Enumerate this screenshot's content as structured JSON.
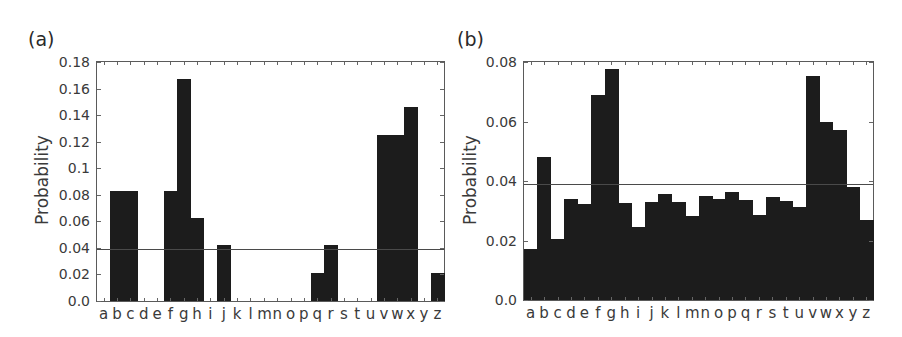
{
  "panels": [
    {
      "label": "(a)",
      "ylabel": "Probability"
    },
    {
      "label": "(b)",
      "ylabel": "Probability"
    }
  ],
  "chart_data": [
    {
      "type": "bar",
      "title": "(a)",
      "xlabel": "",
      "ylabel": "Probability",
      "ylim": [
        0,
        0.18
      ],
      "yticks": [
        "0.0",
        "0.02",
        "0.04",
        "0.06",
        "0.08",
        "0.1",
        "0.12",
        "0.14",
        "0.16",
        "0.18"
      ],
      "ytick_values": [
        0,
        0.02,
        0.04,
        0.06,
        0.08,
        0.1,
        0.12,
        0.14,
        0.16,
        0.18
      ],
      "categories": [
        "a",
        "b",
        "c",
        "d",
        "e",
        "f",
        "g",
        "h",
        "i",
        "j",
        "k",
        "l",
        "m",
        "n",
        "o",
        "p",
        "q",
        "r",
        "s",
        "t",
        "u",
        "v",
        "w",
        "x",
        "y",
        "z"
      ],
      "values": [
        0,
        0.083,
        0.083,
        0,
        0,
        0.083,
        0.167,
        0.0625,
        0,
        0.042,
        0,
        0,
        0,
        0,
        0,
        0,
        0.021,
        0.042,
        0,
        0,
        0,
        0.125,
        0.125,
        0.146,
        0,
        0.021
      ],
      "reference_line": 0.0385,
      "reference_line_label": "uniform (1/26)",
      "grid": false,
      "legend": null
    },
    {
      "type": "bar",
      "title": "(b)",
      "xlabel": "",
      "ylabel": "Probability",
      "ylim": [
        0,
        0.08
      ],
      "yticks": [
        "0.0",
        "0.02",
        "0.04",
        "0.06",
        "0.08"
      ],
      "ytick_values": [
        0,
        0.02,
        0.04,
        0.06,
        0.08
      ],
      "categories": [
        "a",
        "b",
        "c",
        "d",
        "e",
        "f",
        "g",
        "h",
        "i",
        "j",
        "k",
        "l",
        "m",
        "n",
        "o",
        "p",
        "q",
        "r",
        "s",
        "t",
        "u",
        "v",
        "w",
        "x",
        "y",
        "z"
      ],
      "values": [
        0.0173,
        0.048,
        0.0206,
        0.0339,
        0.0323,
        0.069,
        0.0777,
        0.0325,
        0.0244,
        0.033,
        0.0355,
        0.033,
        0.0282,
        0.035,
        0.0339,
        0.0362,
        0.0337,
        0.0285,
        0.0346,
        0.0334,
        0.0311,
        0.0752,
        0.0599,
        0.057,
        0.0379,
        0.0268
      ],
      "reference_line": 0.0388,
      "reference_line_label": "uniform (1/26)",
      "grid": false,
      "legend": null
    }
  ],
  "colors": {
    "bar": "#1c1c1c",
    "frame": "#5a5a5a",
    "reference_line": "#4a4a4a",
    "text": "#3a3a3a"
  }
}
